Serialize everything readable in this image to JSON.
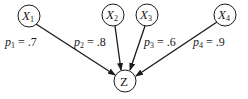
{
  "diagram": {
    "type": "directed-graph",
    "nodes": [
      {
        "id": "X1",
        "label": "X",
        "subscript": "1",
        "cx": 29,
        "cy": 16
      },
      {
        "id": "X2",
        "label": "X",
        "subscript": "2",
        "cx": 113,
        "cy": 15
      },
      {
        "id": "X3",
        "label": "X",
        "subscript": "3",
        "cx": 147,
        "cy": 15
      },
      {
        "id": "X4",
        "label": "X",
        "subscript": "4",
        "cx": 225,
        "cy": 15
      },
      {
        "id": "Z",
        "label": "Z",
        "subscript": "",
        "cx": 125,
        "cy": 81
      }
    ],
    "edges": [
      {
        "from": "X1",
        "to": "Z",
        "label_var": "p",
        "label_sub": "1",
        "label_eq": " = .7",
        "value": 0.7
      },
      {
        "from": "X2",
        "to": "Z",
        "label_var": "p",
        "label_sub": "2",
        "label_eq": " = .8",
        "value": 0.8
      },
      {
        "from": "X3",
        "to": "Z",
        "label_var": "p",
        "label_sub": "3",
        "label_eq": " = .6",
        "value": 0.6
      },
      {
        "from": "X4",
        "to": "Z",
        "label_var": "p",
        "label_sub": "4",
        "label_eq": " = .9",
        "value": 0.9
      }
    ],
    "colors": {
      "stroke": "#1a1a1a",
      "background": "#ffffff"
    }
  }
}
